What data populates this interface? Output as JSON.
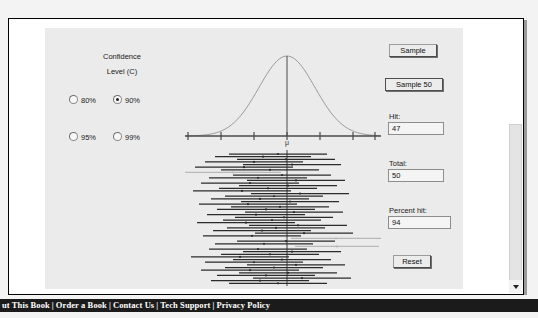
{
  "window": {
    "background_color": "#f3f3f3",
    "page_background": "#ffffff",
    "applet_background": "#ebebeb"
  },
  "scrollbar": {
    "name": "vertical-scrollbar",
    "down_arrow_glyph": "▼"
  },
  "controls": {
    "confidence_title_line1": "Confidence",
    "confidence_title_line2": "Level (C)",
    "radio_options": [
      {
        "label": "80%",
        "selected": false
      },
      {
        "label": "90%",
        "selected": true
      },
      {
        "label": "95%",
        "selected": false
      },
      {
        "label": "99%",
        "selected": false
      }
    ]
  },
  "actions": {
    "sample_label": "Sample",
    "sample50_label": "Sample 50",
    "reset_label": "Reset"
  },
  "readouts": [
    {
      "name": "hit",
      "label": "Hit:",
      "value": "47"
    },
    {
      "name": "total",
      "label": "Total:",
      "value": "50"
    },
    {
      "name": "percent_hit",
      "label": "Percent hit:",
      "value": "94"
    }
  ],
  "graph": {
    "mu_label": "μ",
    "curve_color": "#9a9a9a",
    "axis_color": "#4a4a4a",
    "interval_hit_color": "#2b2b2b",
    "interval_miss_color": "#b9b9b9",
    "tick_count": 7,
    "axis_ticks_x": [
      3,
      36,
      69,
      102,
      135,
      168,
      190
    ]
  },
  "chart_data": {
    "type": "line",
    "title": "",
    "xlabel": "",
    "ylabel": "",
    "mean_label": "μ",
    "normal_curve": {
      "description": "Standard normal density over sampling distribution of the mean",
      "mean_x": 102,
      "sd_px": 28,
      "peak_y": 18,
      "baseline_y": 98
    },
    "confidence_intervals": {
      "count": 50,
      "hits": 47,
      "misses": 3,
      "percent_hit": 94,
      "confidence_level": "90%",
      "rows": [
        {
          "y": 0,
          "left": 44,
          "right": 142,
          "center": 93,
          "hit": true
        },
        {
          "y": 4,
          "left": 30,
          "right": 126,
          "center": 78,
          "hit": true
        },
        {
          "y": 8,
          "left": 52,
          "right": 150,
          "center": 101,
          "hit": true
        },
        {
          "y": 12,
          "left": 20,
          "right": 118,
          "center": 69,
          "hit": true
        },
        {
          "y": 16,
          "left": 58,
          "right": 156,
          "center": 107,
          "hit": true
        },
        {
          "y": 20,
          "left": 10,
          "right": 108,
          "center": 59,
          "hit": true
        },
        {
          "y": 24,
          "left": 36,
          "right": 134,
          "center": 85,
          "hit": true
        },
        {
          "y": 28,
          "left": 0,
          "right": 96,
          "center": 48,
          "hit": false
        },
        {
          "y": 32,
          "left": 48,
          "right": 146,
          "center": 97,
          "hit": true
        },
        {
          "y": 36,
          "left": 24,
          "right": 122,
          "center": 73,
          "hit": true
        },
        {
          "y": 40,
          "left": 62,
          "right": 160,
          "center": 111,
          "hit": true
        },
        {
          "y": 44,
          "left": 16,
          "right": 114,
          "center": 65,
          "hit": true
        },
        {
          "y": 48,
          "left": 54,
          "right": 152,
          "center": 103,
          "hit": true
        },
        {
          "y": 52,
          "left": 34,
          "right": 132,
          "center": 83,
          "hit": true
        },
        {
          "y": 56,
          "left": 8,
          "right": 106,
          "center": 57,
          "hit": true
        },
        {
          "y": 60,
          "left": 66,
          "right": 164,
          "center": 115,
          "hit": true
        },
        {
          "y": 64,
          "left": 40,
          "right": 138,
          "center": 89,
          "hit": true
        },
        {
          "y": 68,
          "left": 26,
          "right": 124,
          "center": 75,
          "hit": true
        },
        {
          "y": 72,
          "left": 56,
          "right": 154,
          "center": 105,
          "hit": true
        },
        {
          "y": 76,
          "left": 14,
          "right": 112,
          "center": 63,
          "hit": true
        },
        {
          "y": 80,
          "left": 46,
          "right": 144,
          "center": 95,
          "hit": true
        },
        {
          "y": 84,
          "left": 32,
          "right": 130,
          "center": 81,
          "hit": true
        },
        {
          "y": 88,
          "left": 60,
          "right": 158,
          "center": 109,
          "hit": true
        },
        {
          "y": 92,
          "left": 22,
          "right": 120,
          "center": 71,
          "hit": true
        },
        {
          "y": 96,
          "left": 50,
          "right": 148,
          "center": 99,
          "hit": true
        },
        {
          "y": 100,
          "left": 38,
          "right": 136,
          "center": 87,
          "hit": true
        },
        {
          "y": 104,
          "left": 12,
          "right": 110,
          "center": 61,
          "hit": true
        },
        {
          "y": 108,
          "left": 64,
          "right": 162,
          "center": 113,
          "hit": true
        },
        {
          "y": 112,
          "left": 42,
          "right": 140,
          "center": 91,
          "hit": true
        },
        {
          "y": 116,
          "left": 28,
          "right": 126,
          "center": 77,
          "hit": true
        },
        {
          "y": 120,
          "left": 70,
          "right": 168,
          "center": 119,
          "hit": true
        },
        {
          "y": 124,
          "left": 18,
          "right": 116,
          "center": 67,
          "hit": true
        },
        {
          "y": 128,
          "left": 106,
          "right": 196,
          "center": 151,
          "hit": false
        },
        {
          "y": 132,
          "left": 52,
          "right": 150,
          "center": 101,
          "hit": true
        },
        {
          "y": 136,
          "left": 30,
          "right": 128,
          "center": 79,
          "hit": true
        },
        {
          "y": 140,
          "left": 110,
          "right": 194,
          "center": 152,
          "hit": false
        },
        {
          "y": 144,
          "left": 24,
          "right": 122,
          "center": 73,
          "hit": true
        },
        {
          "y": 148,
          "left": 58,
          "right": 156,
          "center": 107,
          "hit": true
        },
        {
          "y": 152,
          "left": 36,
          "right": 134,
          "center": 85,
          "hit": true
        },
        {
          "y": 156,
          "left": 6,
          "right": 104,
          "center": 55,
          "hit": true
        },
        {
          "y": 160,
          "left": 48,
          "right": 146,
          "center": 97,
          "hit": true
        },
        {
          "y": 164,
          "left": 20,
          "right": 118,
          "center": 69,
          "hit": true
        },
        {
          "y": 168,
          "left": 62,
          "right": 160,
          "center": 111,
          "hit": true
        },
        {
          "y": 172,
          "left": 40,
          "right": 138,
          "center": 89,
          "hit": true
        },
        {
          "y": 176,
          "left": 16,
          "right": 114,
          "center": 65,
          "hit": true
        },
        {
          "y": 180,
          "left": 54,
          "right": 152,
          "center": 103,
          "hit": true
        },
        {
          "y": 184,
          "left": 32,
          "right": 130,
          "center": 81,
          "hit": true
        },
        {
          "y": 188,
          "left": 68,
          "right": 166,
          "center": 117,
          "hit": true
        },
        {
          "y": 192,
          "left": 26,
          "right": 124,
          "center": 75,
          "hit": true
        },
        {
          "y": 196,
          "left": 44,
          "right": 142,
          "center": 93,
          "hit": true
        }
      ]
    }
  },
  "footer": {
    "links": [
      "ut This Book",
      "Order a Book",
      "Contact Us",
      "Tech Support",
      "Privacy Policy"
    ],
    "separator": "|"
  }
}
